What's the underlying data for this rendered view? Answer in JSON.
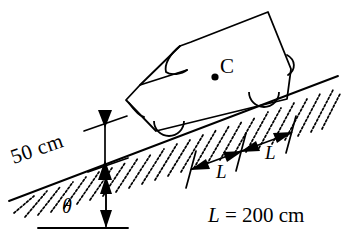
{
  "diagram": {
    "background_color": "#ffffff",
    "line_color": "#000000",
    "labels": {
      "height_dimension": "50 cm",
      "incline_angle": "θ",
      "center_of_mass": "C",
      "wheelbase_front_segment": "L",
      "wheelbase_rear_segment": "L",
      "length_value_prefix": "L",
      "length_value_equals": " = 200 cm"
    },
    "measurements": {
      "height_cm": 50,
      "L_cm": 200,
      "incline_angle_symbol": "θ"
    },
    "elements": {
      "vehicle": "car",
      "surface": "hatched-inclined-plane",
      "baseline": "horizontal-reference-line",
      "wheels": 2,
      "center_of_mass_marker": "filled-dot"
    }
  }
}
